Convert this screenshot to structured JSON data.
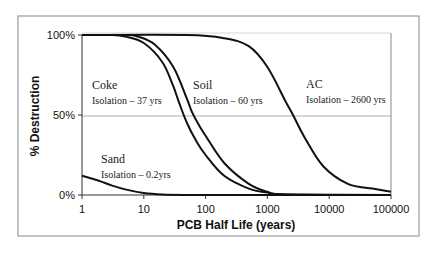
{
  "chart_data": {
    "type": "line",
    "title": "",
    "xlabel": "PCB Half Life (years)",
    "ylabel": "% Destruction",
    "x_scale": "log",
    "xlim": [
      1,
      100000
    ],
    "ylim": [
      0,
      100
    ],
    "x_ticks": [
      "1",
      "10",
      "100",
      "1000",
      "10000",
      "100000"
    ],
    "y_ticks": [
      "0%",
      "50%",
      "100%"
    ],
    "grid": {
      "horizontal_at": [
        50
      ],
      "vertical": false
    },
    "legend": null,
    "series": [
      {
        "name": "Sand",
        "annotation": "Isolation – 0.2yrs",
        "x": [
          1,
          2,
          3,
          5,
          10,
          20,
          50,
          100,
          1000,
          100000
        ],
        "y": [
          12,
          8.5,
          6,
          3.5,
          1.2,
          0.3,
          0,
          0,
          0,
          0
        ]
      },
      {
        "name": "Coke",
        "annotation": "Isolation – 37 yrs",
        "x": [
          1,
          3,
          5,
          10,
          20,
          30,
          37,
          50,
          70,
          100,
          200,
          500,
          1000,
          2000,
          100000
        ],
        "y": [
          100,
          100,
          99,
          95,
          83,
          68,
          58,
          45,
          34,
          25,
          12,
          4,
          1.5,
          0.3,
          0
        ]
      },
      {
        "name": "Soil",
        "annotation": "Isolation – 60 yrs",
        "x": [
          1,
          5,
          8,
          15,
          30,
          50,
          60,
          80,
          100,
          200,
          500,
          1000,
          2000,
          100000
        ],
        "y": [
          100,
          100,
          99,
          94,
          80,
          60,
          52,
          43,
          37,
          20,
          7,
          2,
          0.4,
          0
        ]
      },
      {
        "name": "AC",
        "annotation": "Isolation – 2600 yrs",
        "x": [
          1,
          50,
          200,
          500,
          1000,
          2000,
          2600,
          4000,
          8000,
          20000,
          50000,
          100000
        ],
        "y": [
          100,
          100,
          98,
          93,
          80,
          58,
          50,
          36,
          18,
          7,
          4,
          2
        ]
      }
    ]
  },
  "annotations": [
    {
      "name": "Coke",
      "sub": "Isolation – 37 yrs"
    },
    {
      "name": "Soil",
      "sub": "Isolation – 60 yrs"
    },
    {
      "name": "AC",
      "sub": "Isolation – 2600 yrs"
    },
    {
      "name": "Sand",
      "sub": "Isolation – 0.2yrs"
    }
  ],
  "colors": {
    "line": "#111111",
    "frame": "#777777",
    "grid": "#9a9a9a"
  }
}
